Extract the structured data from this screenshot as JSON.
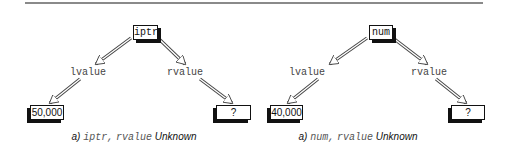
{
  "figure": {
    "panels": [
      {
        "variable": "iptr",
        "left_label": "lvalue",
        "right_label": "rvalue",
        "lvalue_value": "50,000",
        "rvalue_value": "?",
        "caption": {
          "prefix": "a)",
          "code1": "iptr,",
          "code2": "rvalue",
          "suffix": "Unknown"
        }
      },
      {
        "variable": "num",
        "left_label": "lvalue",
        "right_label": "rvalue",
        "lvalue_value": "40,000",
        "rvalue_value": "?",
        "caption": {
          "prefix": "a)",
          "code1": "num,",
          "code2": "rvalue",
          "suffix": "Unknown"
        }
      }
    ]
  }
}
